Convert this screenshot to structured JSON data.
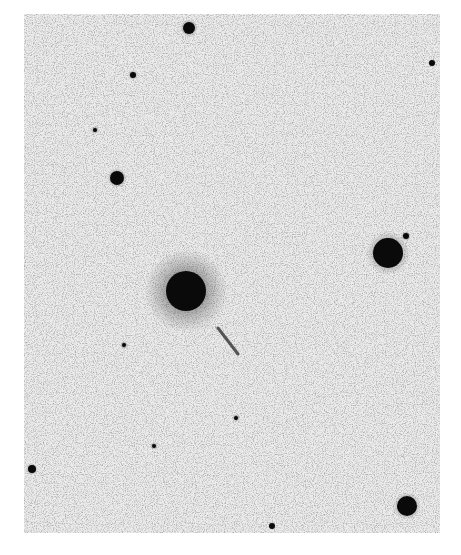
{
  "image": {
    "type": "astronomical-negative-print",
    "description": "Inverted (negative) photographic sky field: dark stars on a light grainy background",
    "background_color": "#e4e4e4",
    "star_color": "#0a0a0a",
    "plate_bounds": {
      "x": 24,
      "y": 14,
      "width": 416,
      "height": 519
    }
  },
  "objects": [
    {
      "name": "central-bright-star",
      "x": 186,
      "y": 291,
      "r": 20,
      "halo": 42
    },
    {
      "name": "right-bright-star",
      "x": 388,
      "y": 253,
      "r": 15,
      "halo": 22
    },
    {
      "name": "top-star",
      "x": 189,
      "y": 28,
      "r": 6,
      "halo": 9
    },
    {
      "name": "left-star",
      "x": 117,
      "y": 178,
      "r": 7,
      "halo": 10
    },
    {
      "name": "bottom-right-star",
      "x": 407,
      "y": 506,
      "r": 10,
      "halo": 14
    },
    {
      "name": "left-edge-faint-star",
      "x": 32,
      "y": 469,
      "r": 4,
      "halo": 6
    },
    {
      "name": "small-star-1",
      "x": 133,
      "y": 75,
      "r": 3,
      "halo": 5
    },
    {
      "name": "small-star-2",
      "x": 432,
      "y": 63,
      "r": 3,
      "halo": 4
    },
    {
      "name": "small-star-3",
      "x": 406,
      "y": 236,
      "r": 3,
      "halo": 5
    },
    {
      "name": "small-star-4",
      "x": 272,
      "y": 526,
      "r": 3,
      "halo": 4
    },
    {
      "name": "small-star-5",
      "x": 236,
      "y": 418,
      "r": 2,
      "halo": 4
    },
    {
      "name": "small-star-6",
      "x": 154,
      "y": 446,
      "r": 2,
      "halo": 4
    },
    {
      "name": "small-star-7",
      "x": 95,
      "y": 130,
      "r": 2,
      "halo": 4
    },
    {
      "name": "small-star-8",
      "x": 124,
      "y": 345,
      "r": 2,
      "halo": 4
    }
  ],
  "streak": {
    "name": "linear-streak",
    "x1": 218,
    "y1": 328,
    "x2": 238,
    "y2": 354
  }
}
